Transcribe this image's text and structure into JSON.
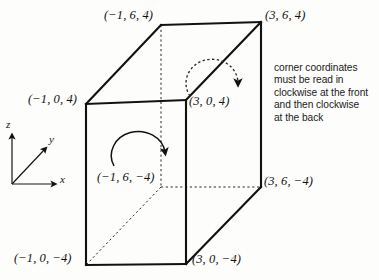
{
  "figure": {
    "width": 379,
    "height": 280,
    "background_color": "#fdfdfc",
    "line_color": "#111111"
  },
  "vertices": [
    {
      "id": "top-back-left",
      "label": "(−1, 6, 4)",
      "x": 161,
      "y": 25,
      "label_x": 104,
      "label_y": 8,
      "hidden": false
    },
    {
      "id": "top-back-right",
      "label": "(3, 6, 4)",
      "x": 261,
      "y": 22,
      "label_x": 265,
      "label_y": 8,
      "hidden": false
    },
    {
      "id": "top-front-left",
      "label": "(−1, 0, 4)",
      "x": 86,
      "y": 104,
      "label_x": 28,
      "label_y": 92,
      "hidden": false
    },
    {
      "id": "top-front-right",
      "label": "(3, 0, 4)",
      "x": 186,
      "y": 100,
      "label_x": 189,
      "label_y": 94,
      "hidden": false
    },
    {
      "id": "bottom-back-left",
      "label": "(−1, 6, −4)",
      "x": 161,
      "y": 187,
      "label_x": 97,
      "label_y": 170,
      "hidden": true
    },
    {
      "id": "bottom-back-right",
      "label": "(3, 6, −4)",
      "x": 261,
      "y": 187,
      "label_x": 264,
      "label_y": 174,
      "hidden": false
    },
    {
      "id": "bottom-front-left",
      "label": "(−1, 0, −4)",
      "x": 86,
      "y": 265,
      "label_x": 14,
      "label_y": 251,
      "hidden": false
    },
    {
      "id": "bottom-front-right",
      "label": "(3, 0, −4)",
      "x": 186,
      "y": 264,
      "label_x": 192,
      "label_y": 252,
      "hidden": false
    }
  ],
  "axes": {
    "origin": {
      "x": 12,
      "y": 184
    },
    "z": {
      "label": "z",
      "tip_x": 12,
      "tip_y": 132,
      "label_x": 6,
      "label_y": 119
    },
    "y": {
      "label": "y",
      "tip_x": 48,
      "tip_y": 146,
      "label_x": 49,
      "label_y": 134
    },
    "x": {
      "label": "x",
      "tip_x": 58,
      "tip_y": 184,
      "label_x": 60,
      "label_y": 174
    }
  },
  "arrows": {
    "front_arc": {
      "style": "solid",
      "description": "clockwise rotation arrow on the front face"
    },
    "back_arc": {
      "style": "dashed",
      "description": "clockwise rotation arrow on the top/back face"
    }
  },
  "annotation": {
    "lines": [
      "corner coordinates",
      "must be read in",
      "clockwise at the front",
      "and then clockwise",
      "at the back"
    ]
  }
}
